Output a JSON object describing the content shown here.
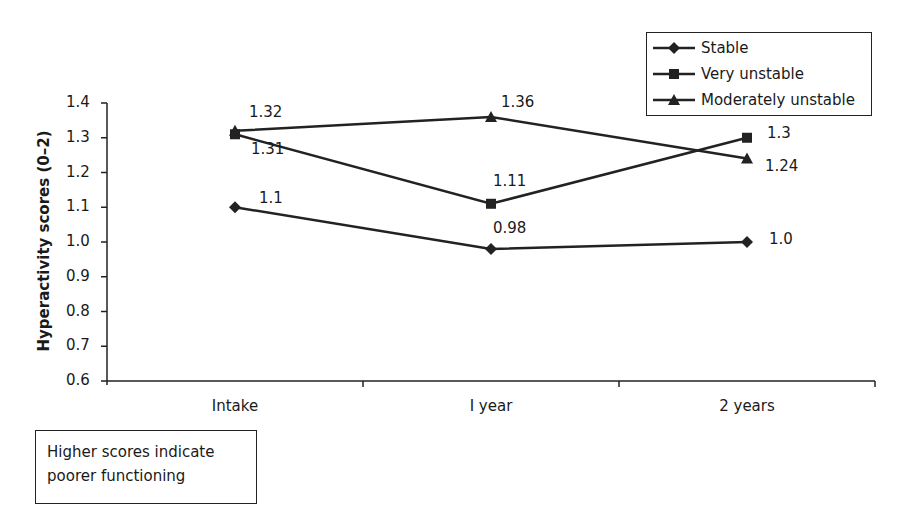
{
  "chart_data": {
    "type": "line",
    "title": "",
    "xlabel": "",
    "ylabel": "Hyperactivity scores (0–2)",
    "ylim": [
      0.6,
      1.4
    ],
    "yticks": [
      "0.6",
      "0.7",
      "0.8",
      "0.9",
      "1.0",
      "1.1",
      "1.2",
      "1.3",
      "1.4"
    ],
    "categories": [
      "Intake",
      "I year",
      "2 years"
    ],
    "grid": false,
    "legend_position": "top-right",
    "series": [
      {
        "name": "Stable",
        "marker": "diamond",
        "values": [
          1.1,
          0.98,
          1.0
        ],
        "labels": [
          "1.1",
          "0.98",
          "1.0"
        ]
      },
      {
        "name": "Very unstable",
        "marker": "square",
        "values": [
          1.31,
          1.11,
          1.3
        ],
        "labels": [
          "1.31",
          "1.11",
          "1.3"
        ]
      },
      {
        "name": "Moderately unstable",
        "marker": "triangle",
        "values": [
          1.32,
          1.36,
          1.24
        ],
        "labels": [
          "1.32",
          "1.36",
          "1.24"
        ]
      }
    ],
    "annotations": [
      "Higher scores indicate poorer functioning"
    ]
  },
  "note": {
    "line1": "Higher scores indicate",
    "line2": "poorer functioning"
  },
  "colors": {
    "line": "#222222",
    "text": "#1a1a1a",
    "background": "#ffffff"
  }
}
